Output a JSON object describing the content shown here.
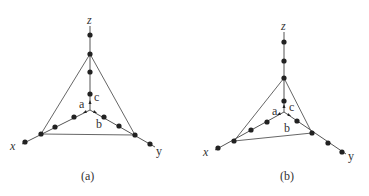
{
  "figure": {
    "panels": [
      {
        "id": "a",
        "caption": "(a)",
        "axis_labels": {
          "x": "x",
          "y": "y",
          "z": "z"
        },
        "vector_labels": {
          "a": "a",
          "b": "b",
          "c": "c"
        },
        "origin": [
          90,
          110
        ],
        "triangle": [
          [
            90,
            54
          ],
          [
            41,
            134
          ],
          [
            135,
            135
          ]
        ],
        "axes": {
          "z": {
            "end": [
              90,
              26
            ],
            "dots": [
              [
                90,
                35
              ],
              [
                90,
                54
              ],
              [
                90,
                72
              ],
              [
                90,
                94
              ]
            ]
          },
          "x": {
            "end": [
              22,
              144
            ],
            "dots": [
              [
                74,
                117
              ],
              [
                55,
                127
              ],
              [
                41,
                134
              ],
              [
                25,
                142
              ]
            ]
          },
          "y": {
            "end": [
              155,
              147
            ],
            "dots": [
              [
                104,
                117
              ],
              [
                119,
                126
              ],
              [
                135,
                135
              ],
              [
                150,
                144
              ]
            ]
          }
        }
      },
      {
        "id": "b",
        "caption": "(b)",
        "axis_labels": {
          "x": "x",
          "y": "y",
          "z": "z"
        },
        "vector_labels": {
          "a": "a",
          "b": "b",
          "c": "c"
        },
        "origin": [
          284,
          112
        ],
        "triangle": [
          [
            284,
            78
          ],
          [
            234,
            141
          ],
          [
            312,
            133
          ]
        ],
        "axes": {
          "z": {
            "end": [
              284,
              32
            ],
            "dots": [
              [
                284,
                42
              ],
              [
                284,
                61
              ],
              [
                284,
                78
              ],
              [
                284,
                101
              ]
            ]
          },
          "x": {
            "end": [
              215,
              150
            ],
            "dots": [
              [
                267,
                122
              ],
              [
                251,
                130
              ],
              [
                234,
                141
              ],
              [
                218,
                148
              ]
            ]
          },
          "y": {
            "end": [
              346,
              154
            ],
            "dots": [
              [
                297,
                119
              ],
              [
                312,
                133
              ],
              [
                328,
                143
              ],
              [
                342,
                152
              ]
            ]
          }
        }
      }
    ]
  },
  "colors": {
    "line": "#555555",
    "dot": "#222222",
    "text": "#333333"
  }
}
